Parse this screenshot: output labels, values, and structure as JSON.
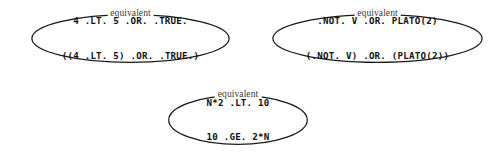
{
  "figure": {
    "background_color": "#ffffff",
    "stroke_color": "#1a1a1a",
    "text_color": "#131313",
    "label_color": "#3a3a3a"
  },
  "groups": [
    {
      "id": "equivalence-group-1",
      "label": "equivalent",
      "lines": [
        "4 .LT. 5 .OR. .TRUE.",
        "((4 .LT. 5) .OR. .TRUE.)"
      ]
    },
    {
      "id": "equivalence-group-2",
      "label": "equivalent",
      "lines": [
        ".NOT. V .OR. PLATO(2)",
        "(.NOT. V) .OR. (PLATO(2))"
      ]
    },
    {
      "id": "equivalence-group-3",
      "label": "equivalent",
      "lines": [
        "N*2 .LT. 10",
        "10 .GE. 2*N"
      ]
    }
  ]
}
